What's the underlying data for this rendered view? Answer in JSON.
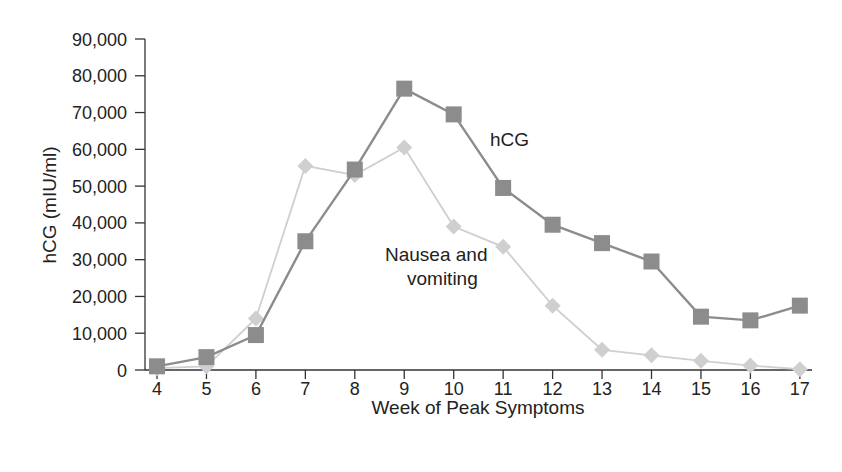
{
  "chart_data": {
    "type": "line",
    "title": "",
    "xlabel": "Week of Peak Symptoms",
    "ylabel": "hCG (mIU/ml)",
    "ylim": [
      0,
      90000
    ],
    "yticks": [
      0,
      10000,
      20000,
      30000,
      40000,
      50000,
      60000,
      70000,
      80000,
      90000
    ],
    "ytick_labels": [
      "0",
      "10,000",
      "20,000",
      "30,000",
      "40,000",
      "50,000",
      "60,000",
      "70,000",
      "80,000",
      "90,000"
    ],
    "x": [
      4,
      5,
      6,
      7,
      8,
      9,
      10,
      11,
      12,
      13,
      14,
      15,
      16,
      17
    ],
    "grid": false,
    "legend": "inline annotations",
    "series": [
      {
        "name": "hCG",
        "marker": "square",
        "color": "#8c8c8c",
        "values": [
          1000,
          3500,
          9500,
          35000,
          54500,
          76500,
          69500,
          49500,
          39500,
          34500,
          29500,
          14500,
          13500,
          17500
        ]
      },
      {
        "name": "Nausea and vomiting",
        "marker": "diamond",
        "color": "#cfcfcf",
        "values": [
          500,
          1000,
          14000,
          55500,
          53000,
          60500,
          39000,
          33500,
          17500,
          5500,
          4000,
          2500,
          1200,
          200
        ]
      }
    ],
    "annotations": [
      {
        "text": "hCG",
        "x": 11,
        "y": 66000
      },
      {
        "text": "Nausea and",
        "x": 11,
        "y": 27000
      },
      {
        "text": "vomiting",
        "x": 11,
        "y": 19500
      }
    ]
  }
}
